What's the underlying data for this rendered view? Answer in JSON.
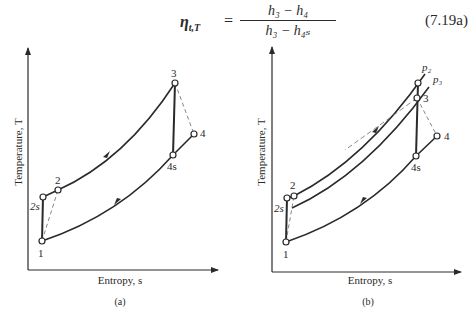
{
  "equation": {
    "lhs_symbol": "η",
    "lhs_subscript": "t,T",
    "equals": "=",
    "numerator": "h₃ − h₄",
    "denominator": "h₃ − h₄ₛ",
    "number": "(7.19a)"
  },
  "panels": [
    {
      "id": "a",
      "caption": "(a)",
      "xlabel": "Entropy, s",
      "ylabel": "Temperature, T",
      "points": {
        "1": "1",
        "2s": "2s",
        "2": "2",
        "3": "3",
        "4": "4",
        "4s": "4s"
      }
    },
    {
      "id": "b",
      "caption": "(b)",
      "xlabel": "Entropy, s",
      "ylabel": "Temperature, T",
      "points": {
        "1": "1",
        "2s": "2s",
        "2": "2",
        "3": "3",
        "4": "4",
        "4s": "4s"
      },
      "pressure_lines": {
        "p2": "p₂",
        "p3": "p₃"
      }
    }
  ],
  "colors": {
    "ink": "#2a2a2a",
    "dashed": "#777777",
    "background": "#ffffff"
  }
}
